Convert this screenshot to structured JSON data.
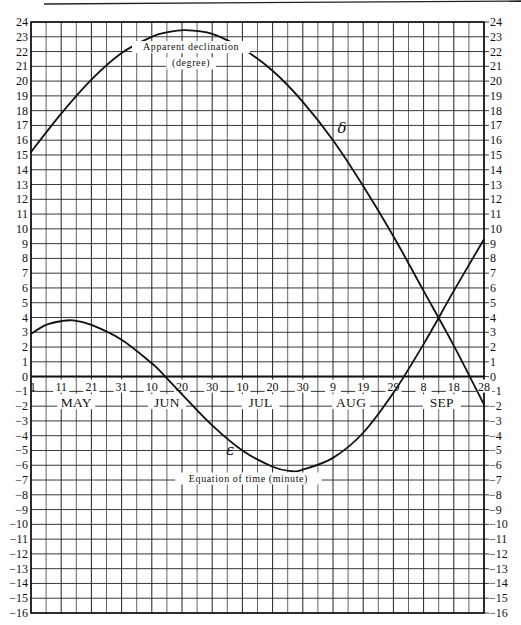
{
  "chart_data": {
    "type": "line",
    "title": "",
    "xlabel": "",
    "ylabel": "",
    "x_unit": "day",
    "x_start": "May 1",
    "x_end": "Sep 28",
    "x_days_range": [
      0,
      150
    ],
    "grid": true,
    "grid_x_step_days": 5,
    "grid_y_step": 1,
    "ylim_left": [
      -16,
      24
    ],
    "ylim_right": [
      -16,
      24
    ],
    "left_ticks": [
      24,
      23,
      22,
      21,
      20,
      19,
      18,
      17,
      16,
      15,
      14,
      13,
      12,
      11,
      10,
      9,
      8,
      7,
      6,
      5,
      4,
      3,
      2,
      1,
      0,
      -1,
      -2,
      -3,
      -4,
      -5,
      -6,
      -7,
      -8,
      -9,
      -10,
      -11,
      -12,
      -13,
      -14,
      -15,
      -16
    ],
    "right_ticks": [
      24,
      23,
      22,
      21,
      20,
      19,
      18,
      17,
      16,
      15,
      14,
      13,
      12,
      11,
      10,
      9,
      8,
      7,
      6,
      5,
      4,
      3,
      2,
      1,
      0,
      -1,
      -2,
      -3,
      -4,
      -5,
      -6,
      -7,
      -8,
      -9,
      -10,
      -11,
      -12,
      -13,
      -14,
      -15,
      -16
    ],
    "x_tick_labels": [
      {
        "label": "1",
        "day": 0
      },
      {
        "label": "11",
        "day": 10
      },
      {
        "label": "21",
        "day": 20
      },
      {
        "label": "31",
        "day": 30
      },
      {
        "label": "10",
        "day": 40
      },
      {
        "label": "20",
        "day": 50
      },
      {
        "label": "30",
        "day": 60
      },
      {
        "label": "10",
        "day": 70
      },
      {
        "label": "20",
        "day": 80
      },
      {
        "label": "30",
        "day": 90
      },
      {
        "label": "9",
        "day": 100
      },
      {
        "label": "19",
        "day": 110
      },
      {
        "label": "29",
        "day": 120
      },
      {
        "label": "8",
        "day": 130
      },
      {
        "label": "18",
        "day": 140
      },
      {
        "label": "28",
        "day": 150
      }
    ],
    "month_labels": [
      {
        "label": "MAY",
        "day": 15
      },
      {
        "label": "JUN",
        "day": 45
      },
      {
        "label": "JUL",
        "day": 76
      },
      {
        "label": "AUG",
        "day": 106
      },
      {
        "label": "SEP",
        "day": 136
      }
    ],
    "series": [
      {
        "name": "Apparent declination (degree)",
        "symbol": "δ",
        "x_days": [
          0,
          10,
          20,
          30,
          40,
          45,
          51,
          60,
          70,
          80,
          90,
          100,
          110,
          120,
          130,
          140,
          150
        ],
        "values": [
          15.2,
          17.8,
          20.1,
          21.9,
          23.0,
          23.3,
          23.45,
          23.2,
          22.2,
          20.7,
          18.6,
          16.0,
          12.9,
          9.5,
          5.8,
          2.1,
          -1.9
        ]
      },
      {
        "name": "Equation of time (minute)",
        "symbol": "ε",
        "x_days": [
          0,
          5,
          10,
          14,
          20,
          30,
          40,
          44,
          50,
          60,
          70,
          80,
          86,
          90,
          100,
          110,
          120,
          130,
          140,
          150
        ],
        "values": [
          2.9,
          3.5,
          3.75,
          3.8,
          3.5,
          2.5,
          0.9,
          0.1,
          -1.2,
          -3.3,
          -5.0,
          -6.1,
          -6.4,
          -6.3,
          -5.5,
          -3.8,
          -1.1,
          2.2,
          5.8,
          9.3
        ]
      }
    ],
    "annotations": [
      {
        "text": "Apparent declination",
        "near_series": "δ",
        "day": 53,
        "value": 22.1
      },
      {
        "text": "(degree)",
        "near_series": "δ",
        "day": 53,
        "value": 21.0
      },
      {
        "text": "δ",
        "day": 103,
        "value": 16.5
      },
      {
        "text": "ε",
        "day": 66,
        "value": -5.3
      },
      {
        "text": "Equation of time (minute)",
        "day": 72,
        "value": -7.1
      }
    ]
  }
}
